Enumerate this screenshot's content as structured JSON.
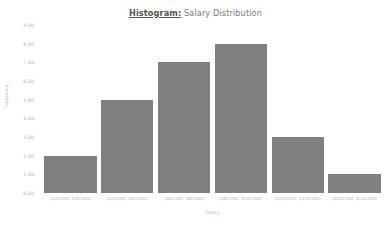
{
  "chart_data": {
    "type": "bar",
    "title": "Histogram: Salary Distribution",
    "title_bold_part": "Histogram:",
    "title_rest_part": " Salary Distribution",
    "xlabel": "Salary",
    "ylabel": "Frequency",
    "categories": [
      "[$20,000, $40,000)",
      "[$40,000, $60,000)",
      "[$60,000, $80,000)",
      "[$80,000, $100,000)",
      "[$100,000, $120,000)",
      "[$120,000, $140,000)"
    ],
    "values": [
      2,
      5,
      7,
      8,
      3,
      1
    ],
    "ylim": [
      0,
      9
    ],
    "ytick_labels": [
      "0.00",
      "1.00",
      "2.00",
      "3.00",
      "4.00",
      "5.00",
      "6.00",
      "7.00",
      "8.00",
      "9.00"
    ],
    "ytick_values": [
      0,
      1,
      2,
      3,
      4,
      5,
      6,
      7,
      8,
      9
    ],
    "grid": false,
    "legend": false,
    "bar_color": "#808080",
    "text_color": "#b4b4b4",
    "background_color": "#ffffff"
  }
}
